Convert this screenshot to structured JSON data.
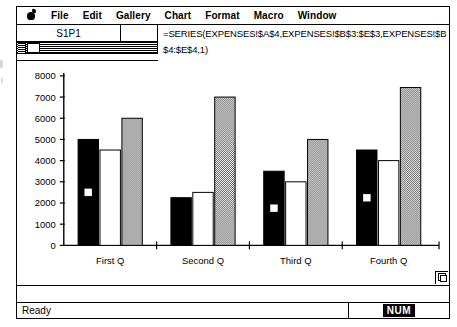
{
  "window": {
    "title_present": false
  },
  "menubar": {
    "apple_icon": "apple-icon",
    "items": [
      {
        "label": "File"
      },
      {
        "label": "Edit"
      },
      {
        "label": "Gallery"
      },
      {
        "label": "Chart"
      },
      {
        "label": "Format"
      },
      {
        "label": "Macro"
      },
      {
        "label": "Window"
      }
    ]
  },
  "formula_bar": {
    "name_box_value": "S1P1",
    "formula": "=SERIES(EXPENSES!$A$4,EXPENSES!$B$3:$E$3,EXPENSES!$B$4:$E$4,1)"
  },
  "status_bar": {
    "message": "Ready",
    "num_lock_label": "NUM"
  },
  "chart_data": {
    "type": "bar",
    "title": "",
    "xlabel": "",
    "ylabel": "",
    "categories": [
      "First Q",
      "Second Q",
      "Third Q",
      "Fourth Q"
    ],
    "ylim": [
      0,
      8000
    ],
    "yticks": [
      0,
      1000,
      2000,
      3000,
      4000,
      5000,
      6000,
      7000,
      8000
    ],
    "ytick_labels": [
      "0",
      "1000",
      "2000",
      "3000",
      "4000",
      "5000",
      "6000",
      "7000",
      "8000"
    ],
    "grid": false,
    "legend": "none",
    "series": [
      {
        "name": "Series 1",
        "fill": "black",
        "color": "#000000",
        "values": [
          5000,
          2250,
          3500,
          4500
        ]
      },
      {
        "name": "Series 2",
        "fill": "white",
        "color": "#ffffff",
        "values": [
          4500,
          2500,
          3000,
          4000
        ]
      },
      {
        "name": "Series 3",
        "fill": "gray",
        "color": "#808080",
        "values": [
          6000,
          7000,
          5000,
          7450
        ]
      }
    ],
    "selection_markers": [
      {
        "category": "First Q",
        "series": "Series 1",
        "value": 2500
      },
      {
        "category": "Third Q",
        "series": "Series 1",
        "value": 1750
      },
      {
        "category": "Fourth Q",
        "series": "Series 1",
        "value": 2250
      }
    ]
  }
}
